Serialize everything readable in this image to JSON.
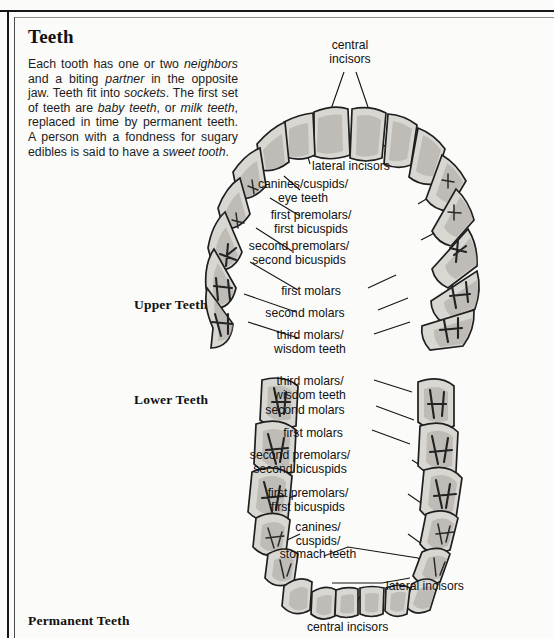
{
  "document": {
    "heading": "Teeth",
    "body_segments": [
      {
        "t": "Each tooth has one or two ",
        "i": false
      },
      {
        "t": "neighbors",
        "i": true
      },
      {
        "t": " and a biting ",
        "i": false
      },
      {
        "t": "partner",
        "i": true
      },
      {
        "t": " in the opposite jaw. Teeth fit into ",
        "i": false
      },
      {
        "t": "sockets",
        "i": true
      },
      {
        "t": ". The first set of teeth are ",
        "i": false
      },
      {
        "t": "baby teeth",
        "i": true
      },
      {
        "t": ", or ",
        "i": false
      },
      {
        "t": "milk teeth",
        "i": true
      },
      {
        "t": ", replaced in time by permanent teeth. A person with a fondness for sugary edibles is said to have a ",
        "i": false
      },
      {
        "t": "sweet tooth",
        "i": true
      },
      {
        "t": ".",
        "i": false
      }
    ],
    "captions": {
      "upper": "Upper Teeth",
      "lower": "Lower Teeth",
      "permanent": "Permanent Teeth"
    }
  },
  "labels": {
    "upper": [
      {
        "id": "upper-central-incisors",
        "lines": [
          "central",
          "incisors"
        ],
        "x": 350,
        "y": 39,
        "align": "c"
      },
      {
        "id": "upper-lateral-incisors",
        "lines": [
          "lateral incisors"
        ],
        "x": 312,
        "y": 160,
        "align": "l"
      },
      {
        "id": "upper-canines",
        "lines": [
          "canines/cuspids/",
          "eye teeth"
        ],
        "x": 303,
        "y": 178,
        "align": "c"
      },
      {
        "id": "upper-first-premolars",
        "lines": [
          "first premolars/",
          "first bicuspids"
        ],
        "x": 311,
        "y": 209,
        "align": "c"
      },
      {
        "id": "upper-second-premolars",
        "lines": [
          "second premolars/",
          "second bicuspids"
        ],
        "x": 299,
        "y": 240,
        "align": "c"
      },
      {
        "id": "upper-first-molars",
        "lines": [
          "first molars"
        ],
        "x": 311,
        "y": 285,
        "align": "c"
      },
      {
        "id": "upper-second-molars",
        "lines": [
          "second molars"
        ],
        "x": 305,
        "y": 307,
        "align": "c"
      },
      {
        "id": "upper-third-molars",
        "lines": [
          "third molars/",
          "wisdom teeth"
        ],
        "x": 310,
        "y": 329,
        "align": "c"
      }
    ],
    "lower": [
      {
        "id": "lower-third-molars",
        "lines": [
          "third molars/",
          "wisdom teeth"
        ],
        "x": 310,
        "y": 375,
        "align": "c"
      },
      {
        "id": "lower-second-molars",
        "lines": [
          "second molars"
        ],
        "x": 305,
        "y": 404,
        "align": "c"
      },
      {
        "id": "lower-first-molars",
        "lines": [
          "first molars"
        ],
        "x": 313,
        "y": 427,
        "align": "c"
      },
      {
        "id": "lower-second-premolars",
        "lines": [
          "second premolars/",
          "second bicuspids"
        ],
        "x": 300,
        "y": 449,
        "align": "c"
      },
      {
        "id": "lower-first-premolars",
        "lines": [
          "first premolars/",
          "first bicuspids"
        ],
        "x": 308,
        "y": 487,
        "align": "c"
      },
      {
        "id": "lower-canines",
        "lines": [
          "canines/",
          "cuspids/",
          "stomach teeth"
        ],
        "x": 318,
        "y": 521,
        "align": "c"
      },
      {
        "id": "lower-lateral-incisors",
        "lines": [
          "lateral incisors"
        ],
        "x": 386,
        "y": 580,
        "align": "l"
      },
      {
        "id": "lower-central-incisors",
        "lines": [
          "central incisors"
        ],
        "x": 307,
        "y": 621,
        "align": "l"
      }
    ]
  },
  "colors": {
    "page_background": "#fbfbf9",
    "ink": "#141414",
    "tooth_fill": "#d9d7d2",
    "tooth_shadow": "#a9a6a1",
    "rule": "#16161a"
  }
}
